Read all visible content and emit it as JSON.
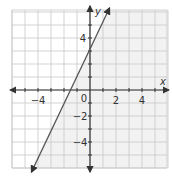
{
  "chart_data": {
    "type": "line",
    "title": "",
    "xlabel": "x",
    "ylabel": "y",
    "xlim": [
      -6,
      6
    ],
    "ylim": [
      -6,
      6
    ],
    "grid": true,
    "grid_step": 1,
    "x_tick_labels": [
      "-4",
      "2",
      "4"
    ],
    "y_tick_labels": [
      "4",
      "-2",
      "-4"
    ],
    "origin_label": "0",
    "series": [
      {
        "name": "y = 2x + 3",
        "equation": "y = 2x + 3",
        "slope": 2,
        "intercept": 3,
        "x": [
          -4.5,
          1.5
        ],
        "y": [
          -6,
          6
        ],
        "arrows_both_ends": true
      }
    ],
    "shaded_region": "right of line (lightly shaded)"
  },
  "colors": {
    "grid": "#c8c8c8",
    "axis": "#333333",
    "line": "#555555",
    "shade": "#f2f2f2"
  }
}
